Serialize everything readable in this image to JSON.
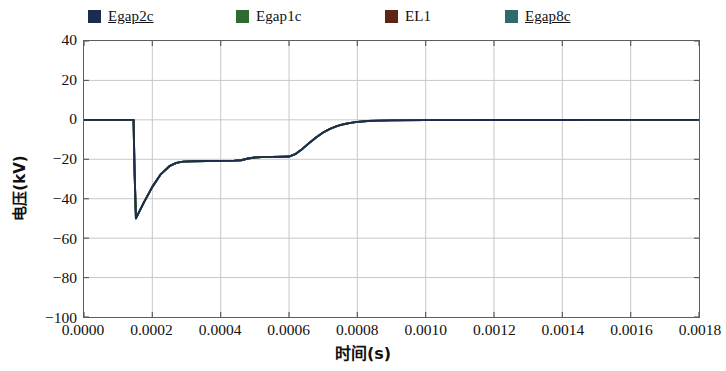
{
  "chart_data": {
    "type": "line",
    "title": "",
    "xlabel": "时间(s)",
    "ylabel": "电压(kV)",
    "xlim": [
      0.0,
      0.0018
    ],
    "ylim": [
      -100,
      40
    ],
    "xticks": [
      "0.0000",
      "0.0002",
      "0.0004",
      "0.0006",
      "0.0008",
      "0.0010",
      "0.0012",
      "0.0014",
      "0.0016",
      "0.0018"
    ],
    "xtick_values": [
      0.0,
      0.0002,
      0.0004,
      0.0006,
      0.0008,
      0.001,
      0.0012,
      0.0014,
      0.0016,
      0.0018
    ],
    "yticks": [
      "40",
      "20",
      "0",
      "-20",
      "-40",
      "-60",
      "-80",
      "-100"
    ],
    "ytick_values": [
      40,
      20,
      0,
      -20,
      -40,
      -60,
      -80,
      -100
    ],
    "grid": true,
    "grid_color": "#c8c8c8",
    "legend_position": "above-plot",
    "series": [
      {
        "name": "Egap2c",
        "color": "#1b2d4f",
        "x": [
          0.0,
          0.000145,
          0.000148,
          0.000152,
          0.000175,
          0.0002,
          0.000225,
          0.00025,
          0.00027,
          0.00029,
          0.00032,
          0.00036,
          0.0004,
          0.00044,
          0.00046,
          0.00048,
          0.0005,
          0.00052,
          0.00055,
          0.00058,
          0.0006,
          0.00062,
          0.00064,
          0.00066,
          0.00068,
          0.0007,
          0.00072,
          0.00074,
          0.00076,
          0.00078,
          0.0008,
          0.00083,
          0.00086,
          0.0009,
          0.001,
          0.0012,
          0.0014,
          0.0016,
          0.0018
        ],
        "y": [
          0.0,
          0.0,
          -26.0,
          -50.0,
          -42.0,
          -34.0,
          -27.5,
          -23.5,
          -21.8,
          -21.2,
          -21.0,
          -20.9,
          -20.8,
          -20.7,
          -20.5,
          -19.6,
          -19.1,
          -18.9,
          -18.8,
          -18.7,
          -18.6,
          -17.2,
          -14.6,
          -11.6,
          -8.8,
          -6.4,
          -4.6,
          -3.2,
          -2.2,
          -1.5,
          -1.0,
          -0.6,
          -0.4,
          -0.25,
          -0.15,
          -0.1,
          -0.05,
          -0.02,
          0.0
        ]
      },
      {
        "name": "Egap1c",
        "color": "#2f6b30",
        "x": [
          0.0,
          0.000145,
          0.000148,
          0.000152,
          0.000175,
          0.0002,
          0.000225,
          0.00025,
          0.00027,
          0.00029,
          0.00032,
          0.00036,
          0.0004,
          0.00044,
          0.00046,
          0.00048,
          0.0005,
          0.00052,
          0.00055,
          0.00058,
          0.0006,
          0.00062,
          0.00064,
          0.00066,
          0.00068,
          0.0007,
          0.00072,
          0.00074,
          0.00076,
          0.00078,
          0.0008,
          0.00083,
          0.00086,
          0.0009,
          0.001,
          0.0012,
          0.0014,
          0.0016,
          0.0018
        ],
        "y": [
          0.0,
          0.0,
          -26.0,
          -50.0,
          -42.0,
          -34.0,
          -27.5,
          -23.5,
          -21.8,
          -21.2,
          -21.0,
          -20.9,
          -20.8,
          -20.7,
          -20.5,
          -19.6,
          -19.1,
          -18.9,
          -18.8,
          -18.7,
          -18.6,
          -17.2,
          -14.6,
          -11.6,
          -8.8,
          -6.4,
          -4.6,
          -3.2,
          -2.2,
          -1.5,
          -1.0,
          -0.6,
          -0.4,
          -0.25,
          -0.15,
          -0.1,
          -0.05,
          -0.02,
          0.0
        ]
      },
      {
        "name": "EL1",
        "color": "#5e2415",
        "x": [
          0.0,
          0.000145,
          0.000148,
          0.000152,
          0.000175,
          0.0002,
          0.000225,
          0.00025,
          0.00027,
          0.00029,
          0.00032,
          0.00036,
          0.0004,
          0.00044,
          0.00046,
          0.00048,
          0.0005,
          0.00052,
          0.00055,
          0.00058,
          0.0006,
          0.00062,
          0.00064,
          0.00066,
          0.00068,
          0.0007,
          0.00072,
          0.00074,
          0.00076,
          0.00078,
          0.0008,
          0.00083,
          0.00086,
          0.0009,
          0.001,
          0.0012,
          0.0014,
          0.0016,
          0.0018
        ],
        "y": [
          0.0,
          0.0,
          -26.0,
          -50.0,
          -42.0,
          -34.0,
          -27.5,
          -23.5,
          -21.8,
          -21.2,
          -21.0,
          -20.9,
          -20.8,
          -20.7,
          -20.5,
          -19.6,
          -19.1,
          -18.9,
          -18.8,
          -18.7,
          -18.6,
          -17.2,
          -14.6,
          -11.6,
          -8.8,
          -6.4,
          -4.6,
          -3.2,
          -2.2,
          -1.5,
          -1.0,
          -0.6,
          -0.4,
          -0.25,
          -0.15,
          -0.1,
          -0.05,
          -0.02,
          0.0
        ]
      },
      {
        "name": "Egap8c",
        "color": "#2d6b70",
        "x": [
          0.0,
          0.000145,
          0.000148,
          0.000152,
          0.000175,
          0.0002,
          0.000225,
          0.00025,
          0.00027,
          0.00029,
          0.00032,
          0.00036,
          0.0004,
          0.00044,
          0.00046,
          0.00048,
          0.0005,
          0.00052,
          0.00055,
          0.00058,
          0.0006,
          0.00062,
          0.00064,
          0.00066,
          0.00068,
          0.0007,
          0.00072,
          0.00074,
          0.00076,
          0.00078,
          0.0008,
          0.00083,
          0.00086,
          0.0009,
          0.001,
          0.0012,
          0.0014,
          0.0016,
          0.0018
        ],
        "y": [
          0.0,
          0.0,
          -26.0,
          -50.0,
          -42.0,
          -34.0,
          -27.5,
          -23.5,
          -21.8,
          -21.2,
          -21.0,
          -20.9,
          -20.8,
          -20.7,
          -20.5,
          -19.6,
          -19.1,
          -18.9,
          -18.8,
          -18.7,
          -18.6,
          -17.2,
          -14.6,
          -11.6,
          -8.8,
          -6.4,
          -4.6,
          -3.2,
          -2.2,
          -1.5,
          -1.0,
          -0.6,
          -0.4,
          -0.25,
          -0.15,
          -0.1,
          -0.05,
          -0.02,
          0.0
        ]
      }
    ]
  },
  "legend": {
    "entries": [
      {
        "label": "Egap2c",
        "color": "#1b2d4f",
        "left": 88,
        "underlined": true
      },
      {
        "label": "Egap1c",
        "color": "#2f6b30",
        "left": 236,
        "underlined": false
      },
      {
        "label": "EL1",
        "color": "#5e2415",
        "left": 385,
        "underlined": false
      },
      {
        "label": "Egap8c",
        "color": "#2d6b70",
        "left": 505,
        "underlined": true
      }
    ]
  },
  "axes": {
    "x_title": "时间(s)",
    "y_title": "电压(kV)"
  }
}
